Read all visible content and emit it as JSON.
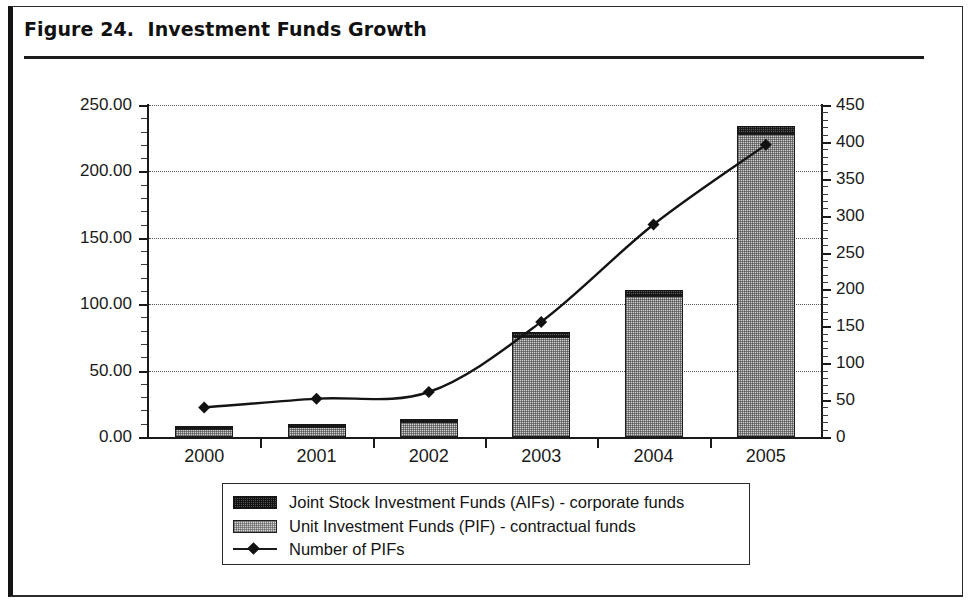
{
  "figure": {
    "title": "Figure 24.  Investment Funds Growth"
  },
  "legend": {
    "items": [
      {
        "label": "Joint Stock Investment Funds (AIFs) - corporate funds",
        "swatch": "dark-hatch-swatch"
      },
      {
        "label": "Unit Investment Funds (PIF) - contractual funds",
        "swatch": "light-hatch-swatch"
      },
      {
        "label": "Number of PIFs",
        "swatch": "line-diamond-marker"
      }
    ]
  },
  "axes": {
    "left_ticks": [
      "0.00",
      "50.00",
      "100.00",
      "150.00",
      "200.00",
      "250.00"
    ],
    "right_ticks": [
      "0",
      "50",
      "100",
      "150",
      "200",
      "250",
      "300",
      "350",
      "400",
      "450"
    ],
    "x_ticks": [
      "2000",
      "2001",
      "2002",
      "2003",
      "2004",
      "2005"
    ]
  },
  "chart_data": {
    "type": "bar",
    "title": "Figure 24.  Investment Funds Growth",
    "subtitle": "",
    "xlabel": "",
    "ylabel": "",
    "y2label": "",
    "categories": [
      "2000",
      "2001",
      "2002",
      "2003",
      "2004",
      "2005"
    ],
    "stacked": true,
    "grid": true,
    "legend_position": "bottom",
    "ylim": [
      0,
      250
    ],
    "y2lim": [
      0,
      450
    ],
    "yticks": [
      0,
      50,
      100,
      150,
      200,
      250
    ],
    "y2ticks": [
      0,
      50,
      100,
      150,
      200,
      250,
      300,
      350,
      400,
      450
    ],
    "series": [
      {
        "name": "Unit Investment Funds (PIF) - contractual funds",
        "axis": "left",
        "kind": "bar",
        "values": [
          6.0,
          7.5,
          11.0,
          75.0,
          106.0,
          228.0
        ]
      },
      {
        "name": "Joint Stock Investment Funds (AIFs) - corporate funds",
        "axis": "left",
        "kind": "bar",
        "values": [
          2.5,
          2.5,
          2.8,
          4.0,
          5.0,
          6.0
        ]
      },
      {
        "name": "Number of PIFs",
        "axis": "right",
        "kind": "line",
        "marker": "diamond",
        "values": [
          40,
          52,
          61,
          156,
          288,
          396
        ]
      }
    ],
    "totals_left_axis": [
      8.5,
      10.0,
      13.8,
      79.0,
      111.0,
      234.0
    ]
  }
}
